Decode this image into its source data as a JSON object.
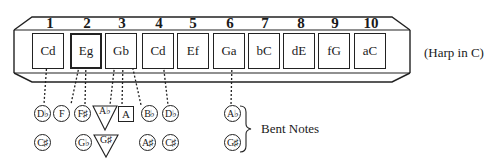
{
  "diagram": {
    "title_note": "(Harp in C)",
    "bent_label": "Bent Notes",
    "holes": [
      {
        "number": "1",
        "notes": "Cd"
      },
      {
        "number": "2",
        "notes": "Eg"
      },
      {
        "number": "3",
        "notes": "Gb"
      },
      {
        "number": "4",
        "notes": "Cd"
      },
      {
        "number": "5",
        "notes": "Ef"
      },
      {
        "number": "6",
        "notes": "Ga"
      },
      {
        "number": "7",
        "notes": "bC"
      },
      {
        "number": "8",
        "notes": "dE"
      },
      {
        "number": "9",
        "notes": "fG"
      },
      {
        "number": "10",
        "notes": "aC"
      }
    ],
    "bent_notes_row1": [
      {
        "label": "D♭",
        "shape": "circle",
        "hole": "1"
      },
      {
        "label": "F",
        "shape": "circle",
        "hole": "2"
      },
      {
        "label": "F♯",
        "shape": "circle",
        "hole": "2"
      },
      {
        "label": "A♭",
        "shape": "triangle",
        "hole": "3"
      },
      {
        "label": "A",
        "shape": "square",
        "hole": "3"
      },
      {
        "label": "B♭",
        "shape": "circle",
        "hole": "3"
      },
      {
        "label": "D♭",
        "shape": "circle",
        "hole": "4"
      },
      {
        "label": "A♭",
        "shape": "circle",
        "hole": "6"
      }
    ],
    "bent_notes_row2": [
      {
        "label": "C♯",
        "shape": "circle",
        "hole": "1"
      },
      {
        "label": "G♭",
        "shape": "circle",
        "hole": "2"
      },
      {
        "label": "G♯",
        "shape": "triangle",
        "hole": "3"
      },
      {
        "label": "A♯",
        "shape": "circle",
        "hole": "3"
      },
      {
        "label": "C♯",
        "shape": "circle",
        "hole": "4"
      },
      {
        "label": "G♯",
        "shape": "circle",
        "hole": "6"
      }
    ]
  }
}
